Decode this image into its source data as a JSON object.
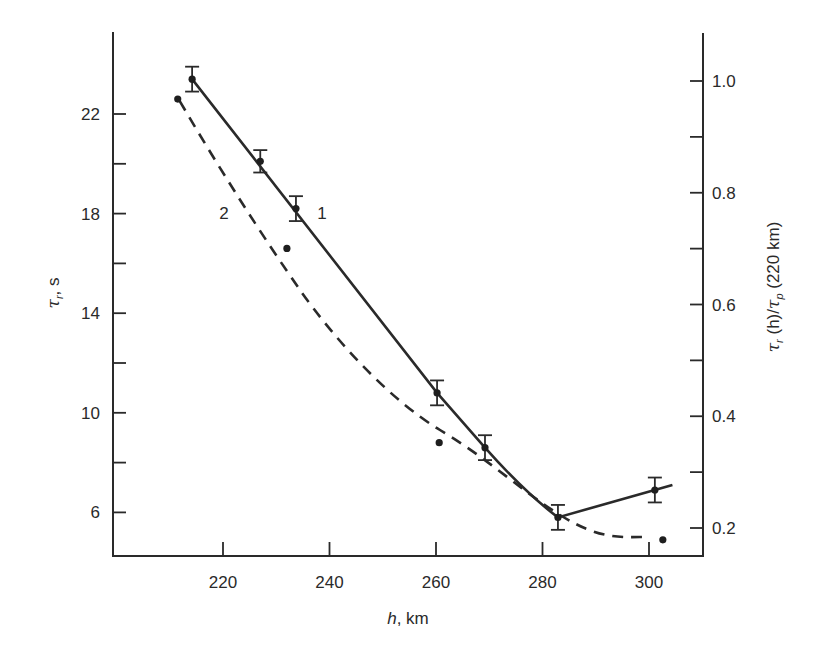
{
  "chart_data": {
    "type": "line",
    "title": "",
    "xlabel": "h, km",
    "ylabel": "τr, s",
    "ylabel_right": "τr (h)/τp (220 km)",
    "xlim": [
      200,
      310
    ],
    "ylim": [
      4.2,
      25.3
    ],
    "ylim_right": [
      0.15,
      1.09
    ],
    "x_ticks": [
      220,
      240,
      260,
      280,
      300
    ],
    "x_tick_labels": [
      "220",
      "240",
      "260",
      "280",
      "300"
    ],
    "y_ticks": [
      6,
      8,
      10,
      12,
      14,
      16,
      18,
      20,
      22
    ],
    "y_tick_labels": [
      "6",
      "",
      "10",
      "",
      "14",
      "",
      "18",
      "",
      "22"
    ],
    "y_right_ticks": [
      0.2,
      0.3,
      0.4,
      0.5,
      0.6,
      0.7,
      0.8,
      0.9,
      1.0
    ],
    "y_right_tick_labels": [
      "0.2",
      "",
      "0.4",
      "",
      "0.6",
      "",
      "0.8",
      "",
      "1.0"
    ],
    "grid": false,
    "legend": "inline labels",
    "series": [
      {
        "name": "1",
        "style": "solid",
        "error_bars": true,
        "points": [
          {
            "x": 214.2,
            "y": 23.4,
            "err": 0.5
          },
          {
            "x": 227.0,
            "y": 20.1,
            "err": 0.45
          },
          {
            "x": 233.7,
            "y": 18.2,
            "err": 0.5
          },
          {
            "x": 260.2,
            "y": 10.8,
            "err": 0.5
          },
          {
            "x": 269.2,
            "y": 8.6,
            "err": 0.5
          },
          {
            "x": 282.9,
            "y": 5.8,
            "err": 0.5
          },
          {
            "x": 301.1,
            "y": 6.9,
            "err": 0.5
          }
        ]
      },
      {
        "name": "2",
        "style": "dashed",
        "error_bars": false,
        "points": [
          {
            "x": 211.5,
            "y": 22.6
          },
          {
            "x": 232.0,
            "y": 16.6
          },
          {
            "x": 260.6,
            "y": 8.8
          },
          {
            "x": 302.6,
            "y": 4.9
          }
        ]
      }
    ],
    "annotations": [
      {
        "text": "1",
        "x": 236.5,
        "y": 18.0
      },
      {
        "text": "2",
        "x": 220.0,
        "y": 18.0
      }
    ]
  }
}
